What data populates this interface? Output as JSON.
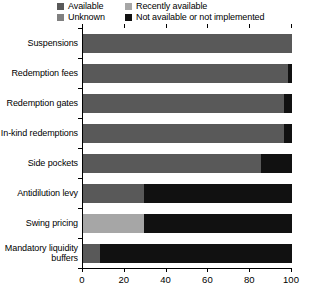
{
  "chart_data": {
    "type": "bar",
    "orientation": "horizontal",
    "stacked": true,
    "title": "",
    "subtitle": "",
    "xlabel": "",
    "ylabel": "",
    "xlim": [
      0,
      100
    ],
    "xticks": [
      0,
      20,
      40,
      60,
      80,
      100
    ],
    "xtick_labels": [
      "0",
      "20",
      "40",
      "60",
      "80",
      "100"
    ],
    "grid": false,
    "legend_position": "top",
    "categories": [
      "Suspensions",
      "Redemption fees",
      "Redemption gates",
      "In-kind redemptions",
      "Side pockets",
      "Antidilution levy",
      "Swing pricing",
      "Mandatory liquidity\nbuffers"
    ],
    "series": [
      {
        "name": "Available",
        "color": "#595959",
        "values": [
          100,
          98,
          96,
          96,
          85,
          29,
          0,
          8
        ]
      },
      {
        "name": "Recently available",
        "color": "#a6a6a6",
        "values": [
          0,
          0,
          0,
          0,
          0,
          0,
          29,
          0
        ]
      },
      {
        "name": "Unknown",
        "color": "#808080",
        "values": [
          0,
          0,
          0,
          0,
          0,
          0,
          0,
          0
        ]
      },
      {
        "name": "Not available or not implemented",
        "color": "#111111",
        "values": [
          0,
          2,
          4,
          4,
          15,
          71,
          71,
          92
        ]
      }
    ]
  },
  "legend": {
    "entries": [
      {
        "label": "Available",
        "color": "#595959"
      },
      {
        "label": "Recently available",
        "color": "#a6a6a6"
      },
      {
        "label": "Unknown",
        "color": "#808080"
      },
      {
        "label": "Not available or not implemented",
        "color": "#111111"
      }
    ]
  }
}
